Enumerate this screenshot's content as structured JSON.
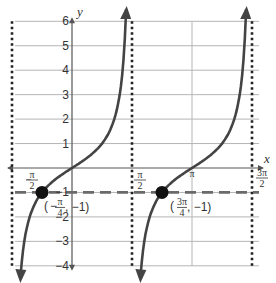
{
  "chart_data": {
    "type": "line",
    "title": "",
    "function": "y = tan(x)",
    "xlabel": "x",
    "ylabel": "y",
    "xlim": [
      -1.5708,
      4.7124
    ],
    "ylim": [
      -4,
      6
    ],
    "grid": true,
    "x_tick_labels": [
      "-π/2",
      "π/2",
      "π",
      "3π/2"
    ],
    "y_tick_labels": [
      "6",
      "5",
      "4",
      "3",
      "2",
      "1",
      "-1",
      "-2",
      "-3",
      "-4"
    ],
    "asymptotes": [
      {
        "x_label": "-π/2",
        "style": "dotted"
      },
      {
        "x_label": "π/2",
        "style": "dotted"
      },
      {
        "x_label": "3π/2",
        "style": "dotted"
      }
    ],
    "reference_line": {
      "y": -1,
      "style": "dashed",
      "color": "#666666"
    },
    "series": [
      {
        "name": "branch-1",
        "domain": [
          "-π/2",
          "π/2"
        ],
        "x_zero": "0",
        "color": "#444444"
      },
      {
        "name": "branch-2",
        "domain": [
          "π/2",
          "3π/2"
        ],
        "x_zero": "π",
        "color": "#444444"
      }
    ],
    "points": [
      {
        "label_x": "-π/4",
        "label_y": "-1",
        "x": -0.7854,
        "y": -1
      },
      {
        "label_x": "3π/4",
        "label_y": "-1",
        "x": 2.3562,
        "y": -1
      }
    ]
  },
  "labels": {
    "x_axis": "x",
    "y_axis": "y",
    "y_ticks": [
      {
        "value": 6,
        "text": "6"
      },
      {
        "value": 5,
        "text": "5"
      },
      {
        "value": 4,
        "text": "4"
      },
      {
        "value": 3,
        "text": "3"
      },
      {
        "value": 2,
        "text": "2"
      },
      {
        "value": 1,
        "text": "1"
      },
      {
        "value": -1,
        "text": "−1"
      },
      {
        "value": -2,
        "text": "−2"
      },
      {
        "value": -3,
        "text": "−3"
      },
      {
        "value": -4,
        "text": "−4"
      }
    ],
    "neg_pi_half": {
      "sign": "−",
      "num": "π",
      "den": "2"
    },
    "pi_half": {
      "num": "π",
      "den": "2"
    },
    "pi": "π",
    "three_pi_half": {
      "num": "3π",
      "den": "2"
    },
    "point1": {
      "open": "(",
      "sign": "−",
      "num": "π",
      "den": "4",
      "rest": ", −1)"
    },
    "point2": {
      "open": "(",
      "num": "3π",
      "den": "4",
      "rest": ", −1)"
    }
  },
  "colors": {
    "grid": "#b5b5b5",
    "axis": "#555555",
    "curve": "#444444",
    "asymptote": "#222222",
    "dashed": "#6a6a6a",
    "point": "#111111"
  }
}
